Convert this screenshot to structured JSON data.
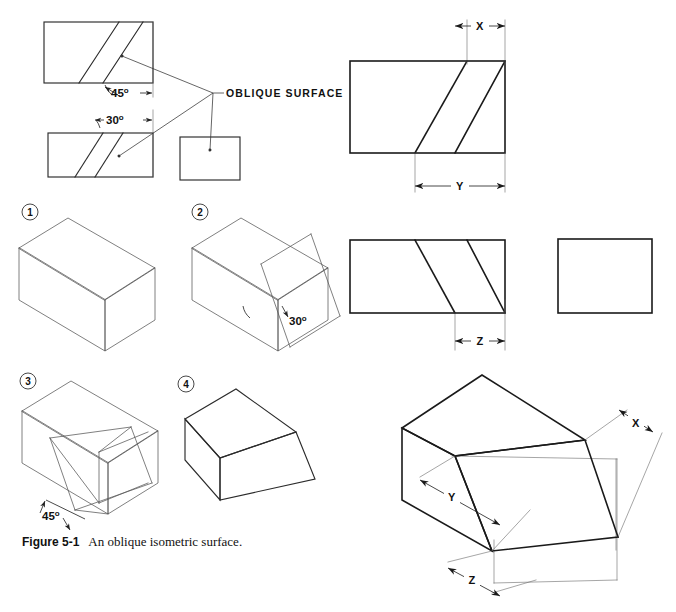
{
  "figure": {
    "caption_label": "Figure 5-1",
    "caption_text": "An oblique isometric surface.",
    "background_color": "#ffffff",
    "line_color": "#1a1a1a"
  },
  "callouts": {
    "oblique_surface": "OBLIQUE SURFACE"
  },
  "angles": {
    "top_view_angle": "45",
    "top_view_angle_unit": "o",
    "front_view_angle": "30",
    "front_view_angle_unit": "o",
    "step2_angle": "30",
    "step2_angle_unit": "o",
    "step3_angle": "45",
    "step3_angle_unit": "o"
  },
  "dimensions": {
    "x_label": "X",
    "y_label": "Y",
    "z_label": "Z",
    "iso_x_label": "X",
    "iso_y_label": "Y",
    "iso_z_label": "Z"
  },
  "steps": [
    {
      "number": "1",
      "name": "plain-isometric-box"
    },
    {
      "number": "2",
      "name": "box-with-30-degree-cut"
    },
    {
      "number": "3",
      "name": "box-with-45-degree-construction"
    },
    {
      "number": "4",
      "name": "finished-oblique-solid"
    }
  ],
  "orthographic_views": {
    "top_view": {
      "name": "top-view-45-degree",
      "rect": {
        "x": 44,
        "y": 22,
        "w": 109,
        "h": 61
      },
      "oblique_lines": [
        {
          "x1": 79,
          "y1": 83,
          "x2": 119,
          "y2": 22
        },
        {
          "x1": 103,
          "y1": 83,
          "x2": 143,
          "y2": 22
        }
      ]
    },
    "front_view": {
      "name": "front-view-30-degree",
      "rect": {
        "x": 48,
        "y": 133,
        "w": 105,
        "h": 44
      },
      "oblique_lines": [
        {
          "x1": 75,
          "y1": 177,
          "x2": 103,
          "y2": 133
        },
        {
          "x1": 95,
          "y1": 177,
          "x2": 123,
          "y2": 133
        }
      ]
    },
    "side_view": {
      "name": "side-view-plain-rectangle",
      "rect": {
        "x": 180,
        "y": 137,
        "w": 60,
        "h": 43
      }
    },
    "dimensioned_top_view": {
      "name": "dimensioned-top-view",
      "rect": {
        "x": 350,
        "y": 61,
        "w": 155,
        "h": 92
      },
      "oblique_lines": [
        {
          "x1": 415,
          "y1": 153,
          "x2": 467,
          "y2": 61
        },
        {
          "x1": 455,
          "y1": 153,
          "x2": 505,
          "y2": 61
        }
      ]
    },
    "dimensioned_front_view": {
      "name": "dimensioned-front-view",
      "rect": {
        "x": 350,
        "y": 240,
        "w": 155,
        "h": 73
      },
      "oblique_lines": [
        {
          "x1": 455,
          "y1": 313,
          "x2": 415,
          "y2": 240
        },
        {
          "x1": 505,
          "y1": 313,
          "x2": 467,
          "y2": 240
        }
      ]
    },
    "dimensioned_side_view": {
      "name": "dimensioned-side-view-rectangle",
      "rect": {
        "x": 558,
        "y": 239,
        "w": 94,
        "h": 74
      }
    }
  }
}
